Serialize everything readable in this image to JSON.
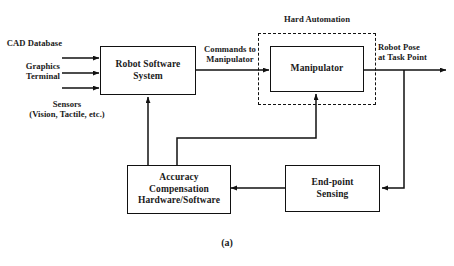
{
  "figure": {
    "caption": "(a)",
    "type": "block-diagram"
  },
  "blocks": {
    "robot_software_system": {
      "label": "Robot Software\nSystem"
    },
    "manipulator": {
      "label": "Manipulator"
    },
    "accuracy_compensation": {
      "label": "Accuracy\nCompensation\nHardware/Software"
    },
    "end_point_sensing": {
      "label": "End-point\nSensing"
    }
  },
  "groups": {
    "hard_automation": {
      "label": "Hard Automation"
    }
  },
  "inputs": [
    {
      "label": "CAD Database"
    },
    {
      "label": "Graphics\nTerminal"
    },
    {
      "label": "Sensors\n(Vision, Tactile, etc.)"
    }
  ],
  "signals": {
    "commands_to_manipulator": {
      "label": "Commands to\nManipulator"
    },
    "robot_pose": {
      "label": "Robot Pose\nat Task Point"
    }
  },
  "colors": {
    "line": "#111111",
    "background": "#ffffff",
    "text": "#1a1a1a"
  }
}
